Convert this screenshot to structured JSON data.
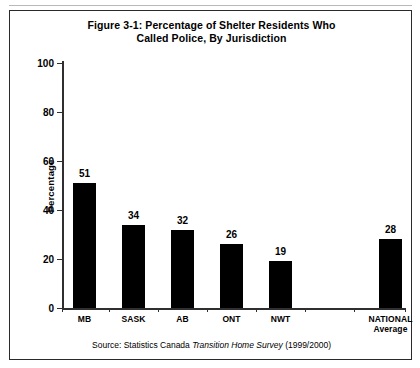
{
  "figure": {
    "title_line1": "Figure 3-1: Percentage of Shelter Residents Who",
    "title_line2": "Called Police, By Jurisdiction",
    "source_prefix": "Source: Statistics Canada",
    "source_italic": "Transition Home Survey",
    "source_suffix": "(1999/2000)"
  },
  "chart_data": {
    "type": "bar",
    "title": "Figure 3-1: Percentage of Shelter Residents Who Called Police, By Jurisdiction",
    "categories": [
      "MB",
      "SASK",
      "AB",
      "ONT",
      "NWT",
      "NATIONAL Average"
    ],
    "category_labels": [
      {
        "main": "MB",
        "sub": ""
      },
      {
        "main": "SASK",
        "sub": ""
      },
      {
        "main": "AB",
        "sub": ""
      },
      {
        "main": "ONT",
        "sub": ""
      },
      {
        "main": "NWT",
        "sub": ""
      },
      {
        "main": "NATIONAL",
        "sub": "Average"
      }
    ],
    "values": [
      51,
      34,
      32,
      26,
      19,
      28
    ],
    "xlabel": "",
    "ylabel": "Percentage",
    "ylim": [
      0,
      100
    ],
    "yticks": [
      0,
      20,
      40,
      60,
      80,
      100
    ],
    "ytick_labels": [
      "0",
      "20",
      "40",
      "60",
      "80",
      "100"
    ],
    "grid": false,
    "legend": false,
    "bar_color": "#000000",
    "data_labels": [
      "51",
      "34",
      "32",
      "26",
      "19",
      "28"
    ]
  }
}
